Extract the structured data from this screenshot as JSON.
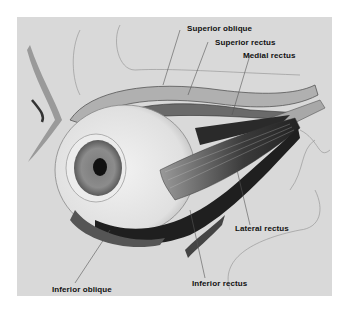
{
  "diagram": {
    "labels": {
      "superior_oblique": "Superior oblique",
      "superior_rectus": "Superior rectus",
      "medial_rectus": "Medial rectus",
      "lateral_rectus": "Lateral rectus",
      "inferior_rectus": "Inferior rectus",
      "inferior_oblique": "Inferior oblique"
    }
  }
}
